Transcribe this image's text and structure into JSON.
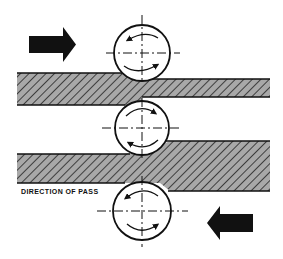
{
  "diagram": {
    "caption": "DIRECTION OF PASS",
    "colors": {
      "ink": "#111111",
      "hatch_fill": "#a8a8a8",
      "background": "#ffffff"
    },
    "arrows": [
      {
        "id": "top-pass-arrow",
        "direction": "right",
        "x": 29,
        "y": 27,
        "w": 46,
        "h": 35
      },
      {
        "id": "bottom-pass-arrow",
        "direction": "left",
        "x": 207,
        "y": 206,
        "w": 46,
        "h": 34
      }
    ],
    "rolls": [
      {
        "id": "upper-roll",
        "cx": 142,
        "cy": 53,
        "r": 28,
        "rotation": "clockwise-top-left-arrows"
      },
      {
        "id": "middle-roll",
        "cx": 142,
        "cy": 128,
        "r": 28,
        "rotation": "clockwise"
      },
      {
        "id": "lower-roll",
        "cx": 142,
        "cy": 211,
        "r": 29,
        "rotation": "counter-clockwise"
      }
    ],
    "workpieces": [
      {
        "id": "upper-bar",
        "entry": {
          "x": 17,
          "y": 73,
          "h": 32
        },
        "exit": {
          "x": 142,
          "y": 79,
          "h": 18,
          "end": 270
        }
      },
      {
        "id": "lower-bar",
        "entry": {
          "x": 170,
          "y": 141,
          "h": 50,
          "end": 270
        },
        "exit": {
          "x": 17,
          "y": 154,
          "h": 29
        }
      }
    ]
  }
}
